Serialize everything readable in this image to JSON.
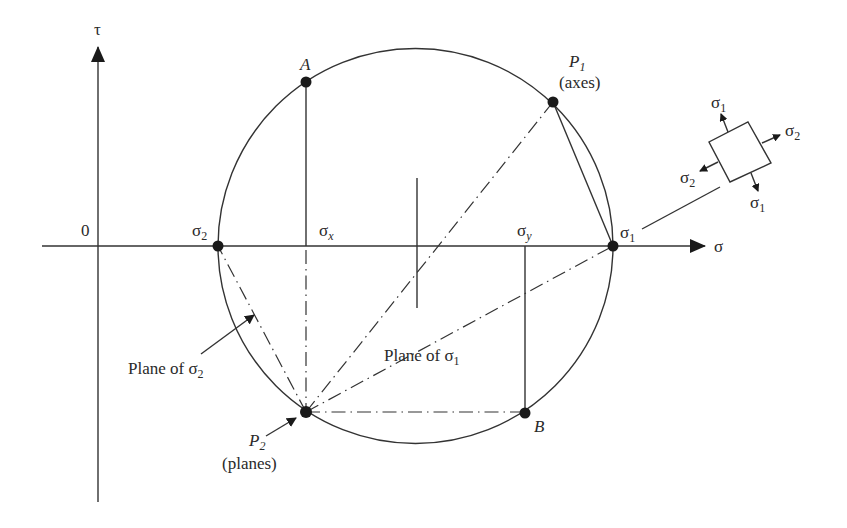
{
  "figure": {
    "type": "Mohr's circle construction",
    "axes": {
      "horizontal_label": "σ",
      "vertical_label": "τ",
      "origin_label": "0"
    },
    "axis_labels": {
      "sigma_x": {
        "base": "σ",
        "sub": "x"
      },
      "sigma_y": {
        "base": "σ",
        "sub": "y"
      },
      "sigma_1": {
        "base": "σ",
        "sub": "1"
      },
      "sigma_2": {
        "base": "σ",
        "sub": "2"
      }
    },
    "points": {
      "A": {
        "label": "A"
      },
      "B": {
        "label": "B"
      },
      "P1": {
        "base": "P",
        "sub": "1",
        "caption": "(axes)"
      },
      "P2": {
        "base": "P",
        "sub": "2",
        "caption": "(planes)"
      }
    },
    "annotations": {
      "plane_sigma_1": {
        "text": "Plane of ",
        "base": "σ",
        "sub": "1"
      },
      "plane_sigma_2": {
        "text": "Plane of ",
        "base": "σ",
        "sub": "2"
      }
    },
    "element": {
      "arrows": [
        {
          "base": "σ",
          "sub": "1",
          "direction": "up"
        },
        {
          "base": "σ",
          "sub": "2",
          "direction": "right"
        },
        {
          "base": "σ",
          "sub": "2",
          "direction": "left"
        },
        {
          "base": "σ",
          "sub": "1",
          "direction": "down"
        }
      ]
    },
    "colors": {
      "line": "#333333",
      "point": "#1a1a1a",
      "background": "#ffffff"
    }
  }
}
